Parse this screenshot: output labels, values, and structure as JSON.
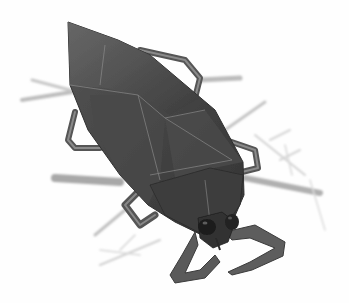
{
  "image": {
    "subject": "giant water bug illustration",
    "style": "grayscale pencil and watercolor",
    "background": "#ffffff",
    "colors": {
      "body_dark": "#3a3a3a",
      "body_mid": "#5a5a5a",
      "body_light": "#7a7a7a",
      "stems": "#b5b5b5",
      "stems_faint": "#d4d4d4"
    }
  }
}
